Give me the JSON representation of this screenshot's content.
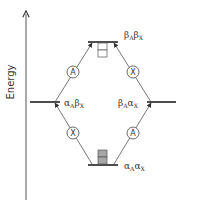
{
  "axis": {
    "label": "Energy"
  },
  "levels": {
    "top": {
      "greek1": "β",
      "sub1": "A",
      "greek2": "β",
      "sub2": "X"
    },
    "left": {
      "greek1": "α",
      "sub1": "A",
      "greek2": "β",
      "sub2": "X"
    },
    "right": {
      "greek1": "β",
      "sub1": "A",
      "greek2": "α",
      "sub2": "X"
    },
    "bottom": {
      "greek1": "α",
      "sub1": "A",
      "greek2": "α",
      "sub2": "X"
    }
  },
  "transitions": {
    "left_to_top": "A",
    "right_to_top": "X",
    "bottom_to_left": "X",
    "bottom_to_right": "A"
  },
  "populations": {
    "top": "empty",
    "bottom": "filled"
  },
  "colors": {
    "line": "#333333",
    "fill": "#a6a6a6",
    "empty": "#ffffff"
  }
}
